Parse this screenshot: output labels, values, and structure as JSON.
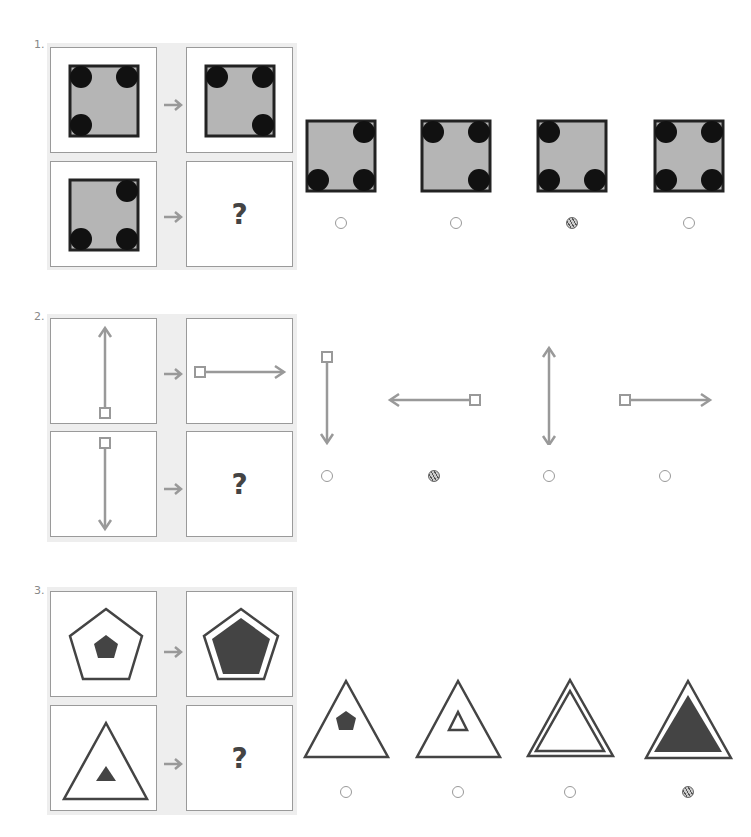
{
  "colors": {
    "panel_bg": "#eeeeee",
    "panel_border": "#9a9a9a",
    "square_fill": "#b5b5b5",
    "square_border": "#222222",
    "dot": "#111111",
    "arrow_gray": "#999999",
    "shape_dark": "#444444"
  },
  "problems": [
    {
      "number": "1.",
      "question_mark": "?",
      "example_pairs": [
        {
          "input": "square with circles at top-left, top-right, bottom-left",
          "output": "square with circles at top-left, top-right, bottom-right"
        },
        {
          "input": "square with circles at top-right, bottom-left, bottom-right",
          "output": "?"
        }
      ],
      "options": [
        {
          "label": "square with circles at top-right, bottom-left, bottom-right",
          "selected": false
        },
        {
          "label": "square with circles at top-left, top-right, bottom-right",
          "selected": false
        },
        {
          "label": "square with circles at top-left, bottom-left, bottom-right",
          "selected": true
        },
        {
          "label": "square with circles at all four corners",
          "selected": false
        }
      ]
    },
    {
      "number": "2.",
      "question_mark": "?",
      "example_pairs": [
        {
          "input": "vertical arrow pointing up, square at bottom",
          "output": "horizontal arrow pointing right, square at left"
        },
        {
          "input": "vertical arrow pointing down, square at top",
          "output": "?"
        }
      ],
      "options": [
        {
          "label": "vertical arrow pointing down, square at top",
          "selected": false
        },
        {
          "label": "horizontal arrow pointing left, square at right",
          "selected": true
        },
        {
          "label": "double-headed vertical arrow",
          "selected": false
        },
        {
          "label": "horizontal arrow pointing right, square at left",
          "selected": false
        }
      ]
    },
    {
      "number": "3.",
      "question_mark": "?",
      "example_pairs": [
        {
          "input": "outline pentagon with small filled pentagon inside",
          "output": "outline pentagon with large filled pentagon inside"
        },
        {
          "input": "outline triangle with small filled triangle inside",
          "output": "?"
        }
      ],
      "options": [
        {
          "label": "outline triangle with small filled pentagon inside",
          "selected": false
        },
        {
          "label": "outline triangle with small outline triangle inside",
          "selected": false
        },
        {
          "label": "outline triangle with large outline triangle inside",
          "selected": false
        },
        {
          "label": "outline triangle with large filled triangle inside",
          "selected": true
        }
      ]
    }
  ]
}
